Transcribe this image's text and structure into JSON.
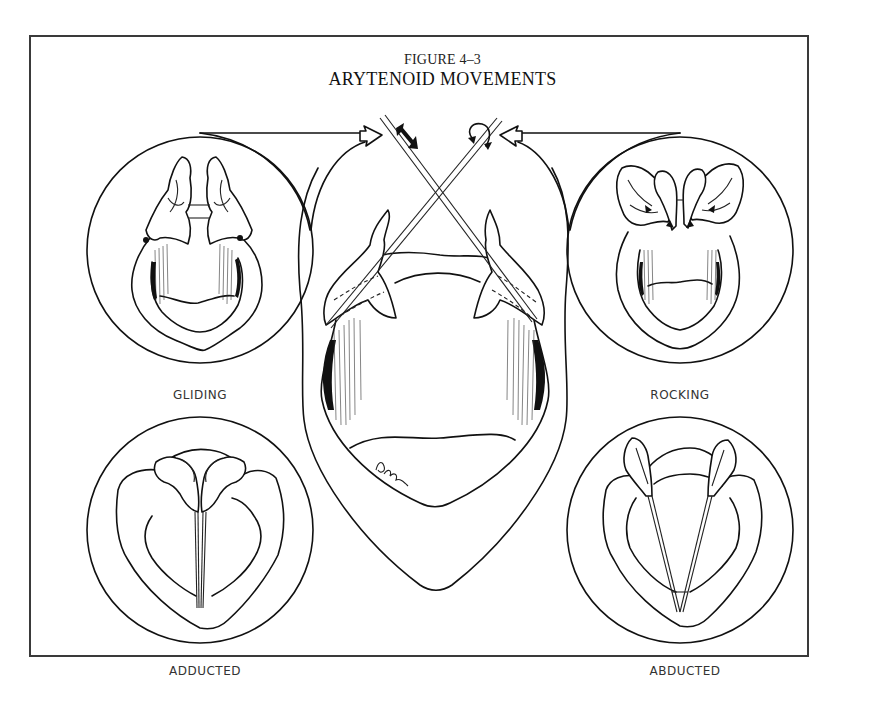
{
  "figure": {
    "number": "FIGURE 4–3",
    "title": "ARYTENOID MOVEMENTS"
  },
  "panels": [
    {
      "id": "gliding",
      "label": "GLIDING",
      "position": "top-left"
    },
    {
      "id": "rocking",
      "label": "ROCKING",
      "position": "top-right"
    },
    {
      "id": "adducted",
      "label": "ADDUCTED",
      "position": "bottom-left"
    },
    {
      "id": "abducted",
      "label": "ABDUCTED",
      "position": "bottom-right"
    },
    {
      "id": "center",
      "label": "",
      "position": "center",
      "description": "Larynx viewed from above with crossed rods indicating arytenoid axes"
    }
  ],
  "annotations": {
    "gliding_arrow": "double-headed arrow (sliding motion)",
    "rocking_arrow": "curved rotation arrow",
    "signature": "Pechini"
  },
  "colors": {
    "ink": "#111111",
    "background": "#ffffff",
    "frame": "#3a3a3a"
  }
}
